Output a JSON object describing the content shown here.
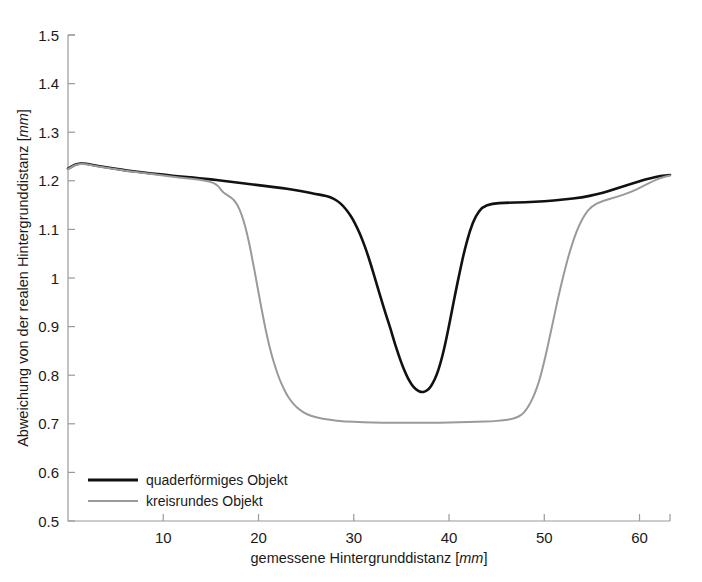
{
  "chart_data": {
    "type": "line",
    "title": "",
    "xlabel": "gemessene Hintergrunddistanz [mm]",
    "xlabel_text": "gemessene Hintergrunddistanz",
    "xlabel_unit": "mm",
    "ylabel": "Abweichung von der realen Hintergrunddistanz [mm]",
    "ylabel_text": "Abweichung von der realen Hintergrunddistanz",
    "ylabel_unit": "mm",
    "xlim": [
      0,
      63.2
    ],
    "ylim": [
      0.5,
      1.5
    ],
    "xticks": [
      10,
      20,
      30,
      40,
      50,
      60
    ],
    "xtick_labels": [
      "10",
      "20",
      "30",
      "40",
      "50",
      "60"
    ],
    "yticks": [
      0.5,
      0.6,
      0.7,
      0.8,
      0.9,
      1.0,
      1.1,
      1.2,
      1.3,
      1.4,
      1.5
    ],
    "ytick_labels": [
      "0.5",
      "0.6",
      "0.7",
      "0.8",
      "0.9",
      "1",
      "1.1",
      "1.2",
      "1.3",
      "1.4",
      "1.5"
    ],
    "grid": false,
    "legend_position": "lower left",
    "series": [
      {
        "name": "quaderförmiges Objekt",
        "color": "#111111",
        "linewidth": 2.6,
        "x": [
          0.0,
          0.5,
          1.0,
          1.6,
          2.2,
          3.0,
          4.0,
          5.0,
          6.2,
          7.5,
          8.8,
          10.0,
          11.2,
          12.5,
          13.8,
          15.0,
          16.2,
          17.5,
          18.8,
          20.0,
          21.2,
          22.5,
          23.8,
          25.0,
          26.0,
          26.8,
          27.4,
          27.9,
          28.4,
          28.9,
          29.4,
          29.9,
          30.4,
          30.9,
          31.4,
          31.9,
          32.4,
          32.9,
          33.4,
          33.9,
          34.3,
          34.7,
          35.1,
          35.5,
          35.9,
          36.3,
          36.7,
          37.1,
          37.5,
          37.9,
          38.3,
          38.7,
          39.1,
          39.5,
          39.9,
          40.3,
          40.7,
          41.1,
          41.6,
          42.2,
          42.8,
          43.5,
          44.5,
          46.0,
          48.0,
          50.0,
          52.0,
          54.0,
          55.5,
          57.0,
          58.5,
          60.0,
          61.2,
          62.2,
          63.2
        ],
        "y": [
          1.225,
          1.231,
          1.235,
          1.236,
          1.234,
          1.231,
          1.228,
          1.225,
          1.221,
          1.218,
          1.215,
          1.213,
          1.21,
          1.208,
          1.205,
          1.203,
          1.2,
          1.197,
          1.194,
          1.191,
          1.188,
          1.185,
          1.181,
          1.177,
          1.173,
          1.17,
          1.167,
          1.163,
          1.157,
          1.148,
          1.136,
          1.121,
          1.102,
          1.079,
          1.052,
          1.021,
          0.988,
          0.955,
          0.923,
          0.893,
          0.866,
          0.842,
          0.82,
          0.801,
          0.786,
          0.775,
          0.768,
          0.765,
          0.766,
          0.772,
          0.783,
          0.8,
          0.824,
          0.855,
          0.892,
          0.932,
          0.972,
          1.01,
          1.055,
          1.098,
          1.128,
          1.146,
          1.153,
          1.155,
          1.156,
          1.158,
          1.161,
          1.166,
          1.172,
          1.18,
          1.19,
          1.199,
          1.206,
          1.21,
          1.212
        ]
      },
      {
        "name": "kreisrundes Objekt",
        "color": "#9a9a9a",
        "linewidth": 2.0,
        "x": [
          0.0,
          0.5,
          1.0,
          1.6,
          2.2,
          3.0,
          4.0,
          5.0,
          6.2,
          7.5,
          8.8,
          10.0,
          11.2,
          12.5,
          13.8,
          15.0,
          15.6,
          15.9,
          16.2,
          16.6,
          17.0,
          17.4,
          17.8,
          18.2,
          18.6,
          19.0,
          19.4,
          19.8,
          20.2,
          20.6,
          21.0,
          21.4,
          21.8,
          22.2,
          22.6,
          23.0,
          23.4,
          23.8,
          24.3,
          25.0,
          26.0,
          27.5,
          29.0,
          31.0,
          33.0,
          35.0,
          37.0,
          39.0,
          41.0,
          43.0,
          44.5,
          45.5,
          46.3,
          47.0,
          47.6,
          48.1,
          48.6,
          49.0,
          49.4,
          49.8,
          50.2,
          50.6,
          51.0,
          51.4,
          51.8,
          52.2,
          52.6,
          53.0,
          53.4,
          53.8,
          54.3,
          55.0,
          56.0,
          57.5,
          59.0,
          60.5,
          61.5,
          62.3,
          63.2
        ],
        "y": [
          1.224,
          1.23,
          1.234,
          1.235,
          1.233,
          1.23,
          1.227,
          1.224,
          1.22,
          1.217,
          1.214,
          1.211,
          1.208,
          1.205,
          1.202,
          1.198,
          1.192,
          1.186,
          1.178,
          1.172,
          1.167,
          1.161,
          1.15,
          1.132,
          1.107,
          1.074,
          1.034,
          0.992,
          0.949,
          0.908,
          0.871,
          0.84,
          0.814,
          0.792,
          0.774,
          0.759,
          0.747,
          0.738,
          0.729,
          0.72,
          0.713,
          0.708,
          0.705,
          0.703,
          0.702,
          0.702,
          0.702,
          0.702,
          0.703,
          0.704,
          0.705,
          0.707,
          0.709,
          0.712,
          0.718,
          0.728,
          0.745,
          0.762,
          0.784,
          0.812,
          0.845,
          0.881,
          0.918,
          0.954,
          0.988,
          1.02,
          1.049,
          1.074,
          1.096,
          1.114,
          1.132,
          1.148,
          1.158,
          1.166,
          1.176,
          1.19,
          1.2,
          1.207,
          1.211
        ]
      }
    ]
  },
  "legend": {
    "items": [
      {
        "label": "quaderförmiges Objekt",
        "color": "#111111"
      },
      {
        "label": "kreisrundes Objekt",
        "color": "#9a9a9a"
      }
    ]
  },
  "axes": {
    "x_tick_labels": [
      "10",
      "20",
      "30",
      "40",
      "50",
      "60"
    ],
    "y_tick_labels": [
      "0.5",
      "0.6",
      "0.7",
      "0.8",
      "0.9",
      "1",
      "1.1",
      "1.2",
      "1.3",
      "1.4",
      "1.5"
    ]
  }
}
